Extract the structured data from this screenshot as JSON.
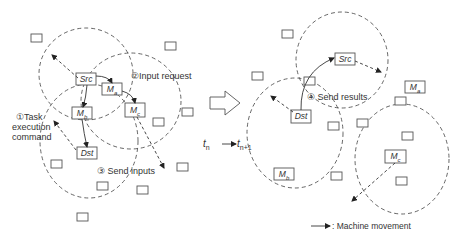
{
  "diagram": {
    "type": "network-transition",
    "left_panel": {
      "time": "t_n",
      "nodes": {
        "src": "Src",
        "ma": "Ma",
        "mb": "Mb",
        "mc": "Mc",
        "dst": "Dst"
      },
      "steps": [
        {
          "num": "①",
          "label_lines": [
            "Task",
            "execution",
            "command"
          ]
        },
        {
          "num": "②",
          "label": "Input request"
        },
        {
          "num": "③",
          "label": "Send inputs"
        }
      ]
    },
    "right_panel": {
      "time": "t_n+1",
      "nodes": {
        "src": "Src",
        "ma": "Ma",
        "mb": "Mb",
        "mc": "Mc",
        "dst": "Dst"
      },
      "steps": [
        {
          "num": "④",
          "label": "Send results"
        }
      ]
    },
    "transition": {
      "from": "t",
      "from_sub": "n",
      "to": "t",
      "to_sub": "n+1"
    },
    "legend": {
      "label": ": Machine movement"
    }
  }
}
